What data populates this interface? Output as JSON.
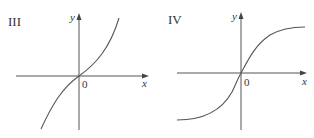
{
  "panels": [
    {
      "label": "III",
      "x_axis_label": "x",
      "y_axis_label": "y",
      "origin_label": "0",
      "curve_type": "cubic-like increasing (concave down left, concave up right)"
    },
    {
      "label": "IV",
      "x_axis_label": "x",
      "y_axis_label": "y",
      "origin_label": "0",
      "curve_type": "sigmoid increasing with horizontal asymptotes"
    }
  ],
  "colors": {
    "stroke": "#555555",
    "text": "#333333",
    "background": "#ffffff"
  }
}
